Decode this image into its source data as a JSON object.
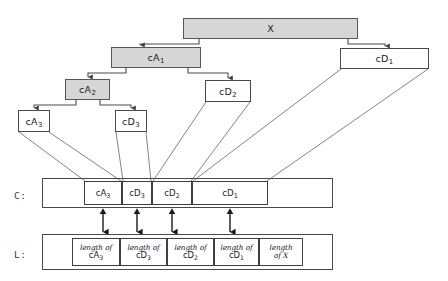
{
  "figure": {
    "colors": {
      "shaded_fill": "#d6d6d6",
      "box_stroke": "#4a4a4a",
      "line_stroke": "#6e6e6e",
      "background": "#ffffff",
      "text": "#1a1a1a"
    }
  },
  "tree": {
    "nodes": [
      {
        "id": "X",
        "label": "X",
        "sub": "",
        "shaded": true,
        "x": 183,
        "y": 18,
        "w": 175,
        "h": 21
      },
      {
        "id": "cA1",
        "label": "cA",
        "sub": "1",
        "shaded": true,
        "x": 111,
        "y": 47,
        "w": 90,
        "h": 21
      },
      {
        "id": "cD1",
        "label": "cD",
        "sub": "1",
        "shaded": false,
        "x": 340,
        "y": 48,
        "w": 89,
        "h": 21
      },
      {
        "id": "cA2",
        "label": "cA",
        "sub": "2",
        "shaded": true,
        "x": 65,
        "y": 79,
        "w": 45,
        "h": 21
      },
      {
        "id": "cD2",
        "label": "cD",
        "sub": "2",
        "shaded": false,
        "x": 205,
        "y": 80,
        "w": 46,
        "h": 22
      },
      {
        "id": "cA3",
        "label": "cA",
        "sub": "3",
        "shaded": false,
        "x": 18,
        "y": 110,
        "w": 32,
        "h": 22
      },
      {
        "id": "cD3",
        "label": "cD",
        "sub": "3",
        "shaded": false,
        "x": 115,
        "y": 110,
        "w": 32,
        "h": 22
      }
    ]
  },
  "c_row": {
    "label": "C:",
    "label_x": 14,
    "label_y": 190,
    "outer": {
      "x": 42,
      "y": 178,
      "w": 291,
      "h": 30
    },
    "segments": [
      {
        "id": "c-cA3",
        "label": "cA",
        "sub": "3",
        "x": 84,
        "y": 181,
        "w": 38,
        "h": 24
      },
      {
        "id": "c-cD3",
        "label": "cD",
        "sub": "3",
        "x": 122,
        "y": 181,
        "w": 30,
        "h": 24
      },
      {
        "id": "c-cD2",
        "label": "cD",
        "sub": "2",
        "x": 152,
        "y": 181,
        "w": 40,
        "h": 24
      },
      {
        "id": "c-cD1",
        "label": "cD",
        "sub": "1",
        "x": 192,
        "y": 181,
        "w": 76,
        "h": 24
      }
    ]
  },
  "l_row": {
    "label": "L:",
    "label_x": 14,
    "label_y": 249,
    "outer": {
      "x": 42,
      "y": 234,
      "w": 291,
      "h": 36
    },
    "cells": [
      {
        "id": "l-cA3",
        "line1": "length of",
        "line2": "cA",
        "sub": "3",
        "x": 72,
        "y": 238,
        "w": 48,
        "h": 28
      },
      {
        "id": "l-cD3",
        "line1": "length of",
        "line2": "cD",
        "sub": "3",
        "x": 120,
        "y": 238,
        "w": 47,
        "h": 28
      },
      {
        "id": "l-cD2",
        "line1": "length of",
        "line2": "cD",
        "sub": "2",
        "x": 167,
        "y": 238,
        "w": 47,
        "h": 28
      },
      {
        "id": "l-cD1",
        "line1": "length of",
        "line2": "cD",
        "sub": "1",
        "x": 214,
        "y": 238,
        "w": 45,
        "h": 28
      },
      {
        "id": "l-X",
        "line1": "length",
        "line2": "of X",
        "sub": "",
        "x": 259,
        "y": 238,
        "w": 44,
        "h": 28
      }
    ]
  },
  "arrows": {
    "tree_edges": [
      {
        "from": "X",
        "to": "cA1",
        "path": "M 199 39 L 199 44 L 140 44 L 140 45"
      },
      {
        "from": "X",
        "to": "cD1",
        "path": "M 348 39 L 348 44 L 385 44 L 385 46"
      },
      {
        "from": "cA1",
        "to": "cA2",
        "path": "M 126 68 L 126 73 L 88 73 L 88 77"
      },
      {
        "from": "cA1",
        "to": "cD2",
        "path": "M 188 68 L 188 73 L 228 73 L 228 78"
      },
      {
        "from": "cA2",
        "to": "cA3",
        "path": "M 76 100 L 76 105 L 34 105 L 34 108"
      },
      {
        "from": "cA2",
        "to": "cD3",
        "path": "M 100 100 L 100 105 L 131 105 L 131 108"
      }
    ],
    "guide_lines": [
      {
        "from": "cA3-left",
        "to": "c-cA3-left",
        "x1": 19,
        "y1": 132,
        "x2": 85,
        "y2": 181
      },
      {
        "from": "cA3-right",
        "to": "c-cA3-right",
        "x1": 49,
        "y1": 132,
        "x2": 121,
        "y2": 181
      },
      {
        "from": "cD3-left",
        "to": "c-cD3-left",
        "x1": 116,
        "y1": 132,
        "x2": 123,
        "y2": 181
      },
      {
        "from": "cD3-right",
        "to": "c-cD3-right",
        "x1": 146,
        "y1": 132,
        "x2": 151,
        "y2": 181
      },
      {
        "from": "cD2-left",
        "to": "c-cD2-left",
        "x1": 206,
        "y1": 102,
        "x2": 153,
        "y2": 181
      },
      {
        "from": "cD2-right",
        "to": "c-cD2-right",
        "x1": 250,
        "y1": 102,
        "x2": 191,
        "y2": 181
      },
      {
        "from": "cD1-left",
        "to": "c-cD1-left",
        "x1": 341,
        "y1": 69,
        "x2": 193,
        "y2": 181
      },
      {
        "from": "cD1-right",
        "to": "c-cD1-right",
        "x1": 428,
        "y1": 69,
        "x2": 267,
        "y2": 181
      }
    ],
    "double_arrows": [
      {
        "id": "link-cA3",
        "x": 103,
        "y1": 208,
        "y2": 238
      },
      {
        "id": "link-cD3",
        "x": 137,
        "y1": 208,
        "y2": 238
      },
      {
        "id": "link-cD2",
        "x": 172,
        "y1": 208,
        "y2": 238
      },
      {
        "id": "link-cD1",
        "x": 230,
        "y1": 208,
        "y2": 238
      }
    ]
  }
}
